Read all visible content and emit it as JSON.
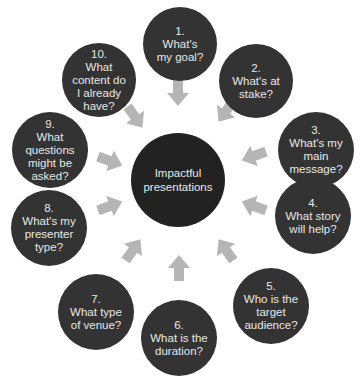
{
  "diagram": {
    "type": "radial-cycle",
    "center": {
      "label": "Impactful presentations"
    },
    "colors": {
      "node_fill": "#333333",
      "center_fill": "#222222",
      "text": "#e8e8e8",
      "arrow": "#b5b5b5",
      "background": "#ffffff"
    },
    "nodes": [
      {
        "number": "1.",
        "question": "What's my goal?"
      },
      {
        "number": "2.",
        "question": "What's at stake?"
      },
      {
        "number": "3.",
        "question": "What's my main message?"
      },
      {
        "number": "4.",
        "question": "What story will help?"
      },
      {
        "number": "5.",
        "question": "Who is the target audience?"
      },
      {
        "number": "6.",
        "question": "What is the duration?"
      },
      {
        "number": "7.",
        "question": "What type of venue?"
      },
      {
        "number": "8.",
        "question": "What's my presenter type?"
      },
      {
        "number": "9.",
        "question": "What questions might be asked?"
      },
      {
        "number": "10.",
        "question": "What content do I already have?"
      }
    ],
    "arrows": {
      "count": 10,
      "direction": "inward-to-center"
    }
  }
}
